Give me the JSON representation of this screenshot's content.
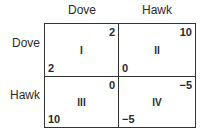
{
  "columns": [
    {
      "label": "Dove"
    },
    {
      "label": "Hawk"
    }
  ],
  "rows": [
    {
      "label": "Dove"
    },
    {
      "label": "Hawk"
    }
  ],
  "cells": [
    {
      "id": "I",
      "row_payoff": "2",
      "col_payoff": "2"
    },
    {
      "id": "II",
      "row_payoff": "0",
      "col_payoff": "10"
    },
    {
      "id": "III",
      "row_payoff": "10",
      "col_payoff": "0"
    },
    {
      "id": "IV",
      "row_payoff": "−5",
      "col_payoff": "−5"
    }
  ]
}
